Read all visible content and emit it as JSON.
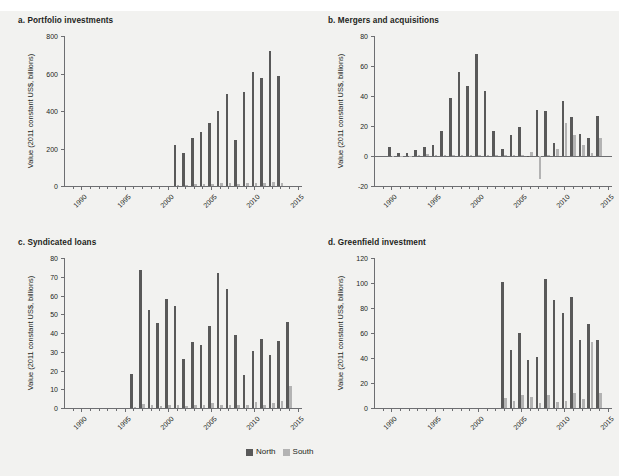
{
  "figure": {
    "background_color": "#f2f2f0",
    "north_color": "#595959",
    "south_color": "#b3b3b3",
    "axis_color": "#6d6e71"
  },
  "legend": {
    "north_label": "North",
    "south_label": "South"
  },
  "chart_data": [
    {
      "type": "bar",
      "panel_id": "a",
      "title": "a. Portfolio investments",
      "xlabel": "",
      "ylabel": "Value (2011 constant US$, billions)",
      "ylim": [
        0,
        800
      ],
      "yticks": [
        0,
        200,
        400,
        600,
        800
      ],
      "ytick_labels": [
        "0",
        "200",
        "400",
        "600",
        "800"
      ],
      "xlim": [
        1988,
        2015.5
      ],
      "xticks": [
        1990,
        1995,
        2000,
        2005,
        2010,
        2015
      ],
      "xtick_labels": [
        "1990",
        "1995",
        "2000",
        "2005",
        "2010",
        "2015"
      ],
      "grid": false,
      "legend_position": "bottom-center",
      "categories": [
        1989,
        1990,
        1991,
        1992,
        1993,
        1994,
        1995,
        1996,
        1997,
        1998,
        1999,
        2000,
        2001,
        2002,
        2003,
        2004,
        2005,
        2006,
        2007,
        2008,
        2009,
        2010,
        2011,
        2012,
        2013,
        2014
      ],
      "series": [
        {
          "name": "North",
          "values": [
            0,
            0,
            0,
            0,
            0,
            0,
            0,
            0,
            0,
            0,
            0,
            0,
            220,
            175,
            256,
            286,
            338,
            400,
            489,
            243,
            499,
            606,
            574,
            718,
            589,
            0
          ]
        },
        {
          "name": "South",
          "values": [
            0,
            0,
            0,
            0,
            0,
            0,
            0,
            0,
            0,
            0,
            0,
            0,
            8,
            7,
            10,
            11,
            12,
            14,
            16,
            10,
            14,
            17,
            16,
            19,
            14,
            0
          ]
        }
      ]
    },
    {
      "type": "bar",
      "panel_id": "b",
      "title": "b. Mergers and acquisitions",
      "xlabel": "",
      "ylabel": "Value (2011 constant US$, billions)",
      "ylim": [
        -20,
        80
      ],
      "yticks": [
        -20,
        0,
        20,
        40,
        60,
        80
      ],
      "ytick_labels": [
        "-20",
        "0",
        "20",
        "40",
        "60",
        "80"
      ],
      "xlim": [
        1988,
        2015.5
      ],
      "xticks": [
        1990,
        1995,
        2000,
        2005,
        2010,
        2015
      ],
      "xtick_labels": [
        "1990",
        "1995",
        "2000",
        "2005",
        "2010",
        "2015"
      ],
      "grid": false,
      "legend_position": "bottom-center",
      "categories": [
        1989,
        1990,
        1991,
        1992,
        1993,
        1994,
        1995,
        1996,
        1997,
        1998,
        1999,
        2000,
        2001,
        2002,
        2003,
        2004,
        2005,
        2006,
        2007,
        2008,
        2009,
        2010,
        2011,
        2012,
        2013,
        2014
      ],
      "series": [
        {
          "name": "North",
          "values": [
            0,
            6.2,
            2.3,
            1.8,
            3.9,
            6.1,
            7.6,
            17.0,
            38.6,
            56.2,
            46.7,
            68.0,
            43.5,
            17.0,
            4.8,
            13.7,
            19.4,
            -0.8,
            30.8,
            30.2,
            8.6,
            36.7,
            25.9,
            14.4,
            12.0,
            26.5
          ]
        },
        {
          "name": "South",
          "values": [
            0,
            0.3,
            0.2,
            0.2,
            0.4,
            1.6,
            0.5,
            0.6,
            0.8,
            0.9,
            1.0,
            0.9,
            0.8,
            0.5,
            0.4,
            0.6,
            0.9,
            2.6,
            -15.2,
            1.0,
            4.6,
            22.3,
            14.2,
            7.6,
            2.0,
            11.8
          ]
        }
      ]
    },
    {
      "type": "bar",
      "panel_id": "c",
      "title": "c. Syndicated loans",
      "xlabel": "",
      "ylabel": "Value (2011 constant US$, billions)",
      "ylim": [
        0,
        80
      ],
      "yticks": [
        0,
        10,
        20,
        30,
        40,
        50,
        60,
        70,
        80
      ],
      "ytick_labels": [
        "0",
        "10",
        "20",
        "30",
        "40",
        "50",
        "60",
        "70",
        "80"
      ],
      "xlim": [
        1988,
        2015.5
      ],
      "xticks": [
        1990,
        1995,
        2000,
        2005,
        2010,
        2015
      ],
      "xtick_labels": [
        "1990",
        "1995",
        "2000",
        "2005",
        "2010",
        "2015"
      ],
      "grid": false,
      "legend_position": "bottom-center",
      "categories": [
        1989,
        1990,
        1991,
        1992,
        1993,
        1994,
        1995,
        1996,
        1997,
        1998,
        1999,
        2000,
        2001,
        2002,
        2003,
        2004,
        2005,
        2006,
        2007,
        2008,
        2009,
        2010,
        2011,
        2012,
        2013,
        2014
      ],
      "series": [
        {
          "name": "North",
          "values": [
            0,
            0,
            0,
            0,
            0,
            0,
            0,
            18.4,
            73.4,
            52.2,
            45.3,
            58.2,
            54.3,
            26.0,
            35.2,
            33.7,
            43.7,
            71.8,
            63.3,
            39.0,
            17.4,
            30.4,
            36.6,
            28.2,
            35.8,
            45.8
          ]
        },
        {
          "name": "South",
          "values": [
            0,
            0,
            0,
            0,
            0,
            0,
            0,
            0.6,
            1.9,
            1.6,
            1.3,
            1.5,
            1.4,
            1.1,
            1.4,
            1.6,
            2.8,
            1.7,
            1.6,
            1.5,
            1.4,
            3.3,
            1.6,
            2.6,
            3.9,
            11.7
          ]
        }
      ]
    },
    {
      "type": "bar",
      "panel_id": "d",
      "title": "d. Greenfield investment",
      "xlabel": "",
      "ylabel": "Value (2011 constant US$, billions)",
      "ylim": [
        0,
        120
      ],
      "yticks": [
        0,
        20,
        40,
        60,
        80,
        100,
        120
      ],
      "ytick_labels": [
        "0",
        "20",
        "40",
        "60",
        "80",
        "100",
        "120"
      ],
      "xlim": [
        1988,
        2015.5
      ],
      "xticks": [
        1990,
        1995,
        2000,
        2005,
        2010,
        2015
      ],
      "xtick_labels": [
        "1990",
        "1995",
        "2000",
        "2005",
        "2010",
        "2015"
      ],
      "grid": false,
      "legend_position": "bottom-center",
      "categories": [
        1989,
        1990,
        1991,
        1992,
        1993,
        1994,
        1995,
        1996,
        1997,
        1998,
        1999,
        2000,
        2001,
        2002,
        2003,
        2004,
        2005,
        2006,
        2007,
        2008,
        2009,
        2010,
        2011,
        2012,
        2013,
        2014
      ],
      "series": [
        {
          "name": "North",
          "values": [
            0,
            0,
            0,
            0,
            0,
            0,
            0,
            0,
            0,
            0,
            0,
            0,
            0,
            0,
            101.2,
            46.4,
            60.4,
            38.4,
            40.6,
            103.4,
            86.2,
            76.2,
            88.6,
            54.4,
            67.0,
            54.3
          ]
        },
        {
          "name": "South",
          "values": [
            0,
            0,
            0,
            0,
            0,
            0,
            0,
            0,
            0,
            0,
            0,
            0,
            0,
            0,
            8.4,
            5.3,
            10.6,
            8.8,
            3.8,
            10.2,
            4.8,
            5.4,
            12.0,
            7.4,
            52.8,
            11.8
          ]
        }
      ]
    }
  ]
}
